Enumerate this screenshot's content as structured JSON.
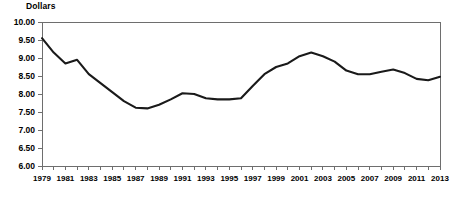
{
  "chart_data": {
    "type": "line",
    "title": "",
    "ylabel": "Dollars",
    "xlabel": "",
    "ylim": [
      6.0,
      10.0
    ],
    "ytick_step": 0.5,
    "xlim": [
      1979,
      2013
    ],
    "grid": false,
    "legend": null,
    "ytick_labels": [
      "10.00",
      "9.50",
      "9.00",
      "8.50",
      "8.00",
      "7.50",
      "7.00",
      "6.50",
      "6.00"
    ],
    "ytick_values": [
      10.0,
      9.5,
      9.0,
      8.5,
      8.0,
      7.5,
      7.0,
      6.5,
      6.0
    ],
    "xtick_labels": [
      "1979",
      "1981",
      "1983",
      "1985",
      "1987",
      "1989",
      "1991",
      "1993",
      "1995",
      "1997",
      "1999",
      "2001",
      "2003",
      "2005",
      "2007",
      "2009",
      "2011",
      "2013"
    ],
    "xtick_values": [
      1979,
      1981,
      1983,
      1985,
      1987,
      1989,
      1991,
      1993,
      1995,
      1997,
      1999,
      2001,
      2003,
      2005,
      2007,
      2009,
      2011,
      2013
    ],
    "x": [
      1979,
      1980,
      1981,
      1982,
      1983,
      1984,
      1985,
      1986,
      1987,
      1988,
      1989,
      1990,
      1991,
      1992,
      1993,
      1994,
      1995,
      1996,
      1997,
      1998,
      1999,
      2000,
      2001,
      2002,
      2003,
      2004,
      2005,
      2006,
      2007,
      2008,
      2009,
      2010,
      2011,
      2012,
      2013
    ],
    "values": [
      9.55,
      9.15,
      8.85,
      8.95,
      8.55,
      8.3,
      8.05,
      7.8,
      7.62,
      7.6,
      7.7,
      7.85,
      8.02,
      8.0,
      7.88,
      7.85,
      7.85,
      7.88,
      8.22,
      8.55,
      8.75,
      8.85,
      9.05,
      9.15,
      9.05,
      8.9,
      8.65,
      8.55,
      8.55,
      8.62,
      8.68,
      8.58,
      8.42,
      8.38,
      8.48
    ],
    "series_name": "Dollars",
    "line_color": "#1a1a1a",
    "axis_color": "#6e6e6e",
    "background_color": "#ffffff"
  }
}
